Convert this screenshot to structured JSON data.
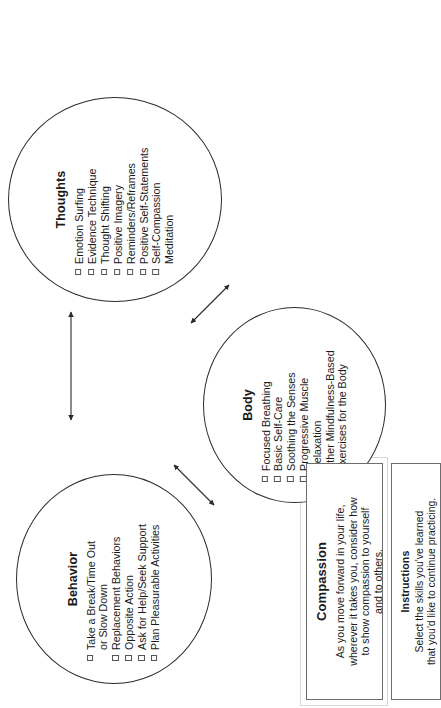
{
  "diagram": {
    "nodes": [
      {
        "id": "behavior",
        "title": "Behavior",
        "items": [
          "Take a Break/Time Out\nor Slow Down",
          "Replacement Behaviors",
          "Opposite Action",
          "Ask for Help/Seek Support",
          "Plan Pleasurable Activities"
        ]
      },
      {
        "id": "body",
        "title": "Body",
        "items": [
          "Focused Breathing",
          "Basic Self-Care",
          "Soothing the Senses",
          "Progressive Muscle Relaxation",
          "Other Mindfulness-Based\nExercises for the Body"
        ]
      },
      {
        "id": "thoughts",
        "title": "Thoughts",
        "items": [
          "Emotion Surfing",
          "Evidence Technique",
          "Thought Shifting",
          "Positive Imagery",
          "Reminders/Reframes",
          "Positive Self-Statements",
          "Self-Compassion\nMeditation"
        ]
      }
    ],
    "connectors": [
      {
        "id": "body-behavior",
        "from": "Body",
        "to": "Behavior",
        "style": "double-headed-arrow"
      },
      {
        "id": "behavior-thoughts",
        "from": "Behavior",
        "to": "Thoughts",
        "style": "double-headed-arrow"
      },
      {
        "id": "body-thoughts",
        "from": "Body",
        "to": "Thoughts",
        "style": "double-headed-arrow"
      }
    ]
  },
  "compassion": {
    "title": "Compassion",
    "body": "As you move forward in your life,\nwherever it takes you, consider how\nto show compassion to yourself\nand to others."
  },
  "instructions": {
    "title": "Instructions",
    "body": "Select the skills you've learned\nthat you'd like to continue practicing."
  },
  "colors": {
    "ink": "#1a1a1a",
    "outline": "#2b2b2b",
    "box_border": "#6d6d6d",
    "checkbox_border": "#555555",
    "background": "#ffffff"
  }
}
